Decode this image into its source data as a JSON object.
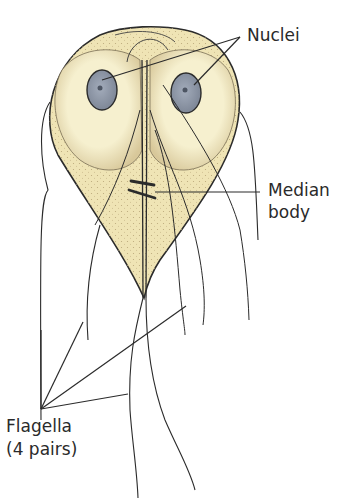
{
  "diagram": {
    "colors": {
      "cytoplasm": "#f3ecc4",
      "stipple": "#b9a77a",
      "nucleus": "#8f98a8",
      "outline": "#2b2b2b",
      "background": "#ffffff"
    },
    "labels": {
      "nuclei": "Nuclei",
      "median_body_line1": "Median",
      "median_body_line2": "body",
      "flagella_line1": "Flagella",
      "flagella_line2": "(4 pairs)"
    }
  }
}
